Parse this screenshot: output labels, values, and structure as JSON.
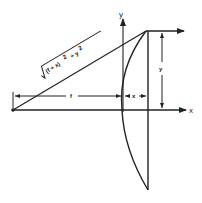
{
  "diagram": {
    "title": "",
    "colors": {
      "stroke": "#222222",
      "background": "#ffffff"
    },
    "axes": {
      "x_label": "x",
      "y_label": "y"
    },
    "labels": {
      "hypotenuse": "√(f + x)² + y²",
      "hyp_radical": "√",
      "hyp_body": "(f + x)",
      "hyp_sq1": "2",
      "hyp_plus": "+ y",
      "hyp_sq2": "2",
      "focal_length": "f",
      "sag": "x",
      "height": "y"
    },
    "elements": [
      "focal point at left",
      "plano-convex lens with curved surface at y-axis",
      "ray from focus to lens edge",
      "outgoing horizontal ray",
      "dimension f from focus to lens vertex",
      "dimension x sag of lens",
      "dimension y height of ray"
    ]
  }
}
